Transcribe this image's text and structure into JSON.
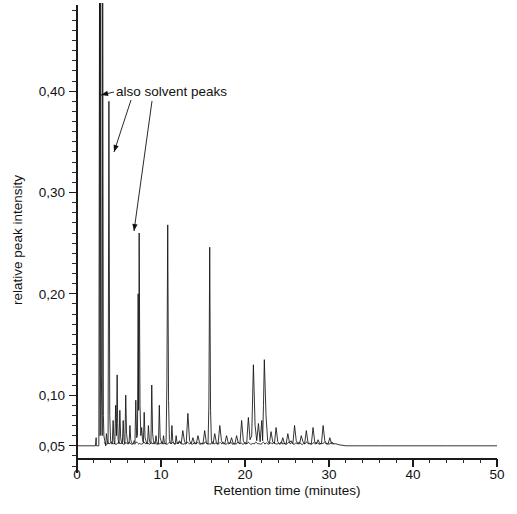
{
  "figure": {
    "background_color": "#ffffff",
    "trace_color": "#111111",
    "axis_color": "#1a1a1a"
  },
  "annotations": [
    {
      "id": "solvent-peaks-note",
      "text": "also solvent peaks",
      "text_x": 116,
      "text_y": 96,
      "arrows": [
        {
          "from_x": 114,
          "from_y": 92,
          "to_x": 101,
          "to_y": 95
        },
        {
          "from_x": 131,
          "from_y": 100,
          "to_x": 114,
          "to_y": 152
        },
        {
          "from_x": 152,
          "from_y": 101,
          "to_x": 134,
          "to_y": 231
        }
      ]
    }
  ],
  "axes": {
    "x": {
      "label": "Retention time (minutes)",
      "ticks": [
        0,
        10,
        20,
        30,
        40,
        50
      ],
      "tick_labels": [
        "0",
        "10",
        "20",
        "30",
        "40",
        "50"
      ],
      "minor_tick_step": 2,
      "range": [
        0,
        50
      ],
      "pixel_start": 77,
      "pixel_end": 497,
      "baseline_pixel_y": 459,
      "label_x": 287,
      "label_y": 495,
      "tick_label_y": 479
    },
    "y": {
      "label": "relative peak intensity",
      "ticks": [
        0.05,
        0.1,
        0.2,
        0.3,
        0.4
      ],
      "tick_labels": [
        "0,05",
        "0,10",
        "0,20",
        "0,30",
        "0,40"
      ],
      "minor_ticks": [
        0.06,
        0.07,
        0.08,
        0.09,
        0.11,
        0.12,
        0.13,
        0.14,
        0.15,
        0.16,
        0.17,
        0.18,
        0.19,
        0.21,
        0.22,
        0.23,
        0.24,
        0.25,
        0.26,
        0.27,
        0.28,
        0.29,
        0.31,
        0.32,
        0.33,
        0.34,
        0.35,
        0.36,
        0.37,
        0.38,
        0.39,
        0.41,
        0.42,
        0.43,
        0.44,
        0.45,
        0.46,
        0.47,
        0.48
      ],
      "range": [
        0.035,
        0.485
      ],
      "pixel_top": 5,
      "pixel_bottom": 461,
      "axis_pixel_x": 77,
      "label_x": 22,
      "label_y": 240
    }
  },
  "chart_data": {
    "type": "line",
    "title": "",
    "xlabel": "Retention time (minutes)",
    "ylabel": "relative peak intensity",
    "xlim": [
      0,
      50
    ],
    "ylim": [
      0.035,
      0.485
    ],
    "grid": false,
    "legend": "none",
    "baseline": 0.05,
    "series_name": "chromatogram",
    "x": [
      0,
      2.2,
      2.28,
      2.3,
      2.34,
      2.4,
      2.5,
      2.6,
      2.68,
      2.72,
      2.76,
      2.82,
      2.9,
      3.0,
      3.06,
      3.1,
      3.14,
      3.2,
      3.3,
      3.42,
      3.5,
      3.6,
      3.7,
      3.8,
      3.9,
      4.0,
      4.1,
      4.2,
      4.3,
      4.4,
      4.5,
      4.6,
      4.7,
      4.78,
      4.84,
      4.9,
      5.0,
      5.1,
      5.2,
      5.3,
      5.4,
      5.5,
      5.6,
      5.7,
      5.8,
      5.9,
      6.0,
      6.1,
      6.2,
      6.3,
      6.4,
      6.5,
      6.6,
      6.7,
      6.8,
      6.9,
      7.0,
      7.1,
      7.2,
      7.28,
      7.34,
      7.4,
      7.5,
      7.6,
      7.7,
      7.8,
      7.9,
      8.0,
      8.1,
      8.2,
      8.3,
      8.4,
      8.5,
      8.6,
      8.7,
      8.8,
      8.9,
      9.0,
      9.1,
      9.2,
      9.3,
      9.4,
      9.5,
      9.6,
      9.7,
      9.8,
      9.9,
      10.0,
      10.1,
      10.2,
      10.3,
      10.4,
      10.5,
      10.6,
      10.7,
      10.8,
      10.9,
      11.0,
      11.1,
      11.2,
      11.3,
      11.4,
      11.5,
      11.6,
      11.7,
      11.8,
      11.9,
      12.0,
      12.2,
      12.4,
      12.6,
      12.8,
      13.0,
      13.2,
      13.4,
      13.6,
      13.8,
      14.0,
      14.2,
      14.4,
      14.6,
      14.8,
      15.0,
      15.2,
      15.4,
      15.6,
      15.7,
      15.8,
      15.9,
      16.0,
      16.1,
      16.2,
      16.4,
      16.6,
      16.8,
      17.0,
      17.2,
      17.4,
      17.6,
      17.8,
      18.0,
      18.2,
      18.4,
      18.6,
      18.8,
      19.0,
      19.2,
      19.4,
      19.6,
      19.8,
      20.0,
      20.2,
      20.4,
      20.6,
      20.8,
      21.0,
      21.2,
      21.4,
      21.6,
      21.8,
      22.0,
      22.1,
      22.2,
      22.3,
      22.5,
      22.7,
      22.9,
      23.1,
      23.3,
      23.5,
      23.7,
      23.9,
      24.1,
      24.3,
      24.5,
      24.7,
      24.9,
      25.1,
      25.3,
      25.5,
      25.7,
      25.9,
      26.1,
      26.3,
      26.5,
      26.7,
      26.9,
      27.1,
      27.3,
      27.5,
      27.7,
      27.9,
      28.1,
      28.3,
      28.5,
      28.7,
      28.9,
      29.1,
      29.3,
      29.5,
      29.7,
      29.9,
      30.1,
      30.3,
      30.5,
      30.8,
      31.2,
      32,
      34,
      36,
      38,
      40,
      44,
      48,
      50
    ],
    "y": [
      0.05,
      0.05,
      0.058,
      0.05,
      0.05,
      0.05,
      0.05,
      0.05,
      0.49,
      0.2,
      0.06,
      0.49,
      0.12,
      0.06,
      0.49,
      0.3,
      0.08,
      0.06,
      0.055,
      0.05,
      0.062,
      0.055,
      0.052,
      0.39,
      0.08,
      0.055,
      0.052,
      0.052,
      0.075,
      0.055,
      0.052,
      0.09,
      0.06,
      0.12,
      0.072,
      0.056,
      0.052,
      0.085,
      0.058,
      0.053,
      0.052,
      0.075,
      0.055,
      0.052,
      0.1,
      0.062,
      0.055,
      0.052,
      0.052,
      0.07,
      0.056,
      0.053,
      0.052,
      0.052,
      0.055,
      0.053,
      0.095,
      0.058,
      0.06,
      0.2,
      0.085,
      0.26,
      0.09,
      0.06,
      0.068,
      0.056,
      0.053,
      0.083,
      0.058,
      0.055,
      0.052,
      0.052,
      0.07,
      0.057,
      0.053,
      0.052,
      0.11,
      0.062,
      0.055,
      0.052,
      0.052,
      0.06,
      0.054,
      0.052,
      0.052,
      0.09,
      0.058,
      0.055,
      0.052,
      0.052,
      0.06,
      0.053,
      0.052,
      0.052,
      0.11,
      0.268,
      0.095,
      0.056,
      0.053,
      0.052,
      0.07,
      0.055,
      0.053,
      0.052,
      0.052,
      0.06,
      0.054,
      0.052,
      0.055,
      0.052,
      0.065,
      0.054,
      0.052,
      0.082,
      0.055,
      0.052,
      0.058,
      0.052,
      0.052,
      0.06,
      0.053,
      0.052,
      0.052,
      0.065,
      0.053,
      0.052,
      0.09,
      0.246,
      0.085,
      0.055,
      0.052,
      0.052,
      0.062,
      0.053,
      0.052,
      0.07,
      0.055,
      0.052,
      0.052,
      0.06,
      0.053,
      0.052,
      0.058,
      0.052,
      0.052,
      0.06,
      0.053,
      0.052,
      0.075,
      0.055,
      0.052,
      0.052,
      0.078,
      0.056,
      0.06,
      0.13,
      0.07,
      0.055,
      0.072,
      0.054,
      0.075,
      0.055,
      0.09,
      0.135,
      0.08,
      0.055,
      0.052,
      0.064,
      0.054,
      0.052,
      0.068,
      0.054,
      0.052,
      0.052,
      0.058,
      0.052,
      0.052,
      0.062,
      0.053,
      0.055,
      0.052,
      0.07,
      0.055,
      0.052,
      0.052,
      0.06,
      0.054,
      0.052,
      0.065,
      0.053,
      0.052,
      0.052,
      0.068,
      0.054,
      0.052,
      0.056,
      0.052,
      0.052,
      0.07,
      0.055,
      0.052,
      0.052,
      0.058,
      0.052,
      0.052,
      0.052,
      0.051,
      0.05,
      0.05,
      0.05,
      0.05,
      0.05,
      0.05,
      0.05,
      0.05,
      0.05
    ],
    "highlighted_peaks": [
      {
        "retention_time": 2.68,
        "intensity": 0.49,
        "label": "solvent peak (off scale)"
      },
      {
        "retention_time": 2.82,
        "intensity": 0.49,
        "label": "solvent peak (off scale)"
      },
      {
        "retention_time": 3.06,
        "intensity": 0.49,
        "label": "solvent peak (off scale)"
      },
      {
        "retention_time": 3.8,
        "intensity": 0.39,
        "label": "also solvent peak"
      },
      {
        "retention_time": 7.4,
        "intensity": 0.26,
        "label": "also solvent peak"
      },
      {
        "retention_time": 11.0,
        "intensity": 0.268,
        "label": ""
      },
      {
        "retention_time": 15.7,
        "intensity": 0.246,
        "label": ""
      },
      {
        "retention_time": 20.1,
        "intensity": 0.13,
        "label": ""
      },
      {
        "retention_time": 22.1,
        "intensity": 0.135,
        "label": ""
      }
    ]
  }
}
